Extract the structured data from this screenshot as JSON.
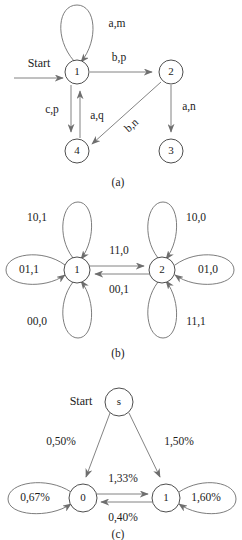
{
  "figure": {
    "panels": [
      {
        "id": "a",
        "caption": "(a)",
        "start_label": "Start",
        "states": [
          {
            "name": "1",
            "cx": 77,
            "cy": 72,
            "r": 12
          },
          {
            "name": "2",
            "cx": 171,
            "cy": 72,
            "r": 12
          },
          {
            "name": "3",
            "cx": 171,
            "cy": 151,
            "r": 12
          },
          {
            "name": "4",
            "cx": 77,
            "cy": 151,
            "r": 12
          }
        ],
        "transitions": [
          {
            "from": "1",
            "to": "1",
            "label": "a,m",
            "kind": "self-loop-top"
          },
          {
            "from": "1",
            "to": "2",
            "label": "b,p",
            "kind": "straight"
          },
          {
            "from": "1",
            "to": "4",
            "label": "c,p",
            "kind": "straight"
          },
          {
            "from": "4",
            "to": "1",
            "label": "a,q",
            "kind": "straight"
          },
          {
            "from": "2",
            "to": "3",
            "label": "a,n",
            "kind": "straight"
          },
          {
            "from": "2",
            "to": "4",
            "label": "b,n",
            "kind": "diagonal"
          }
        ]
      },
      {
        "id": "b",
        "caption": "(b)",
        "states": [
          {
            "name": "1",
            "cx": 77,
            "cy": 90,
            "r": 13
          },
          {
            "name": "2",
            "cx": 162,
            "cy": 90,
            "r": 13
          }
        ],
        "transitions": [
          {
            "from": "1",
            "to": "1",
            "label": "10,1",
            "kind": "self-loop-top"
          },
          {
            "from": "1",
            "to": "1",
            "label": "01,1",
            "kind": "self-loop-left"
          },
          {
            "from": "1",
            "to": "1",
            "label": "00,0",
            "kind": "self-loop-bottom"
          },
          {
            "from": "2",
            "to": "2",
            "label": "10,0",
            "kind": "self-loop-top"
          },
          {
            "from": "2",
            "to": "2",
            "label": "01,0",
            "kind": "self-loop-right"
          },
          {
            "from": "2",
            "to": "2",
            "label": "11,1",
            "kind": "self-loop-bottom"
          },
          {
            "from": "1",
            "to": "2",
            "label": "11,0",
            "kind": "straight-upper"
          },
          {
            "from": "2",
            "to": "1",
            "label": "00,1",
            "kind": "straight-lower"
          }
        ]
      },
      {
        "id": "c",
        "caption": "(c)",
        "start_label": "Start",
        "states": [
          {
            "name": "s",
            "cx": 119,
            "cy": 402,
            "r": 14
          },
          {
            "name": "0",
            "cx": 83,
            "cy": 498,
            "r": 14
          },
          {
            "name": "1",
            "cx": 166,
            "cy": 498,
            "r": 14
          }
        ],
        "transitions": [
          {
            "from": "s",
            "to": "0",
            "label": "0,50%",
            "kind": "diagonal"
          },
          {
            "from": "s",
            "to": "1",
            "label": "1,50%",
            "kind": "diagonal"
          },
          {
            "from": "0",
            "to": "1",
            "label": "1,33%",
            "kind": "straight-upper"
          },
          {
            "from": "1",
            "to": "0",
            "label": "0,40%",
            "kind": "straight-lower"
          },
          {
            "from": "0",
            "to": "0",
            "label": "0,67%",
            "kind": "self-loop-left"
          },
          {
            "from": "1",
            "to": "1",
            "label": "1,60%",
            "kind": "self-loop-right"
          }
        ]
      }
    ]
  }
}
